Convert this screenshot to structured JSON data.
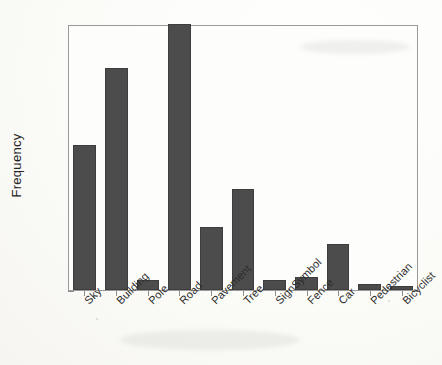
{
  "chart_data": {
    "type": "bar",
    "title": "",
    "xlabel": "",
    "ylabel": "Frequency",
    "categories": [
      "Sky",
      "Building",
      "Pole",
      "Road",
      "Pavement",
      "Tree",
      "SignSymbol",
      "Fence",
      "Car",
      "Pedestrian",
      "Bicyclist"
    ],
    "values": [
      0.163,
      0.25,
      0.011,
      0.3,
      0.071,
      0.114,
      0.011,
      0.015,
      0.052,
      0.007,
      0.005
    ],
    "ylim": [
      0,
      0.3
    ],
    "yticks": [
      0,
      0.05,
      0.1,
      0.15,
      0.2,
      0.25,
      0.3
    ],
    "ytick_labels": [
      "0",
      "0.05",
      "0.1",
      "0.15",
      "0.2",
      "0.25",
      "0.3"
    ],
    "grid": false,
    "legend": null,
    "bar_color": "#4c4c4c",
    "axis_color": "#8e8e8e",
    "background_color": "#fdfdfc"
  }
}
